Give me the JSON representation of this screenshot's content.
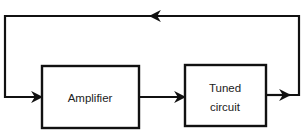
{
  "diagram": {
    "type": "block-diagram",
    "blocks": [
      {
        "id": "amplifier",
        "label_lines": [
          "Amplifier"
        ]
      },
      {
        "id": "tuned-circuit",
        "label_lines": [
          "Tuned",
          "circuit"
        ]
      }
    ],
    "connections": [
      {
        "from": "amplifier",
        "to": "tuned-circuit"
      },
      {
        "from": "tuned-circuit",
        "to": "amplifier",
        "kind": "feedback-loop"
      }
    ],
    "colors": {
      "stroke": "#111111",
      "background": "#ffffff",
      "text": "#222222"
    }
  }
}
